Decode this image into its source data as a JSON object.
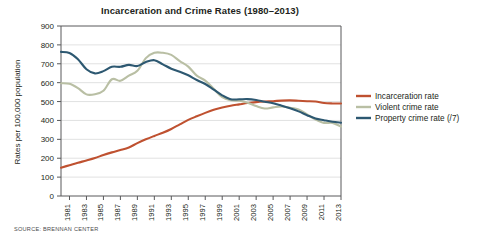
{
  "chart_data": {
    "type": "line",
    "title": "Incarceration and Crime Rates (1980–2013)",
    "xlabel": "",
    "ylabel": "Rates per 100,000 population",
    "ylim": [
      0,
      900
    ],
    "ytick_step": 100,
    "yticks": [
      0,
      100,
      200,
      300,
      400,
      500,
      600,
      700,
      800,
      900
    ],
    "xlim": [
      1980,
      2013
    ],
    "xticks": [
      1981,
      1983,
      1985,
      1987,
      1989,
      1991,
      1993,
      1995,
      1997,
      1999,
      2001,
      2003,
      2005,
      2007,
      2009,
      2011,
      2013
    ],
    "x": [
      1980,
      1981,
      1982,
      1983,
      1984,
      1985,
      1986,
      1987,
      1988,
      1989,
      1990,
      1991,
      1992,
      1993,
      1994,
      1995,
      1996,
      1997,
      1998,
      1999,
      2000,
      2001,
      2002,
      2003,
      2004,
      2005,
      2006,
      2007,
      2008,
      2009,
      2010,
      2011,
      2012,
      2013
    ],
    "grid": true,
    "legend_position": "right",
    "series": [
      {
        "name": "Incarceration rate",
        "color": "#bf5130",
        "values": [
          150,
          163,
          176,
          188,
          201,
          217,
          231,
          243,
          257,
          280,
          300,
          318,
          335,
          355,
          379,
          403,
          422,
          440,
          456,
          468,
          478,
          485,
          492,
          497,
          500,
          502,
          505,
          506,
          504,
          502,
          500,
          492,
          490,
          490
        ]
      },
      {
        "name": "Violent crime rate",
        "color": "#b9bfa4",
        "values": [
          597,
          594,
          571,
          538,
          539,
          557,
          618,
          610,
          637,
          663,
          730,
          758,
          758,
          747,
          714,
          685,
          637,
          611,
          568,
          523,
          507,
          504,
          494,
          476,
          463,
          469,
          474,
          467,
          458,
          432,
          405,
          387,
          387,
          368
        ]
      },
      {
        "name": "Property crime rate (/7)",
        "color": "#2d5871",
        "values": [
          763,
          757,
          724,
          671,
          649,
          661,
          684,
          684,
          694,
          688,
          709,
          719,
          697,
          674,
          658,
          639,
          614,
          593,
          563,
          533,
          512,
          512,
          513,
          508,
          499,
          491,
          478,
          464,
          448,
          428,
          410,
          401,
          393,
          388
        ]
      }
    ]
  },
  "source": {
    "note": "SOURCE: BRENNAN CENTER"
  }
}
